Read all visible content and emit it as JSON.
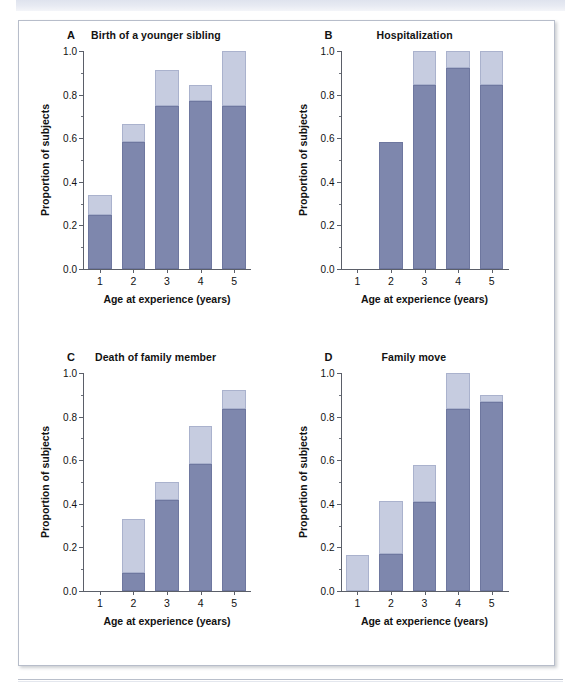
{
  "figure": {
    "axis_color": "#5b5f69",
    "frame_color": "#b7bdca",
    "dark_color": "#7e87ad",
    "light_color": "#c6cce0",
    "y_label": "Proportion of subjects",
    "x_label": "Age at experience (years)",
    "y_ticks": [
      "0.0",
      "0.2",
      "0.4",
      "0.6",
      "0.8",
      "1.0"
    ],
    "x_ticks": [
      "1",
      "2",
      "3",
      "4",
      "5"
    ]
  },
  "panels": [
    {
      "letter": "A",
      "title": "Birth of a younger sibling"
    },
    {
      "letter": "B",
      "title": "Hospitalization"
    },
    {
      "letter": "C",
      "title": "Death of family member"
    },
    {
      "letter": "D",
      "title": "Family move"
    }
  ],
  "chart_data": [
    {
      "type": "bar",
      "panel": "A",
      "title": "Birth of a younger sibling",
      "xlabel": "Age at experience (years)",
      "ylabel": "Proportion of subjects",
      "ylim": [
        0,
        1.0
      ],
      "ytick_values": [
        0.0,
        0.2,
        0.4,
        0.6,
        0.8,
        1.0
      ],
      "grid": false,
      "legend": "none",
      "stacked": true,
      "categories": [
        "1",
        "2",
        "3",
        "4",
        "5"
      ],
      "series": [
        {
          "name": "dark",
          "values": [
            0.25,
            0.585,
            0.75,
            0.77,
            0.75
          ]
        },
        {
          "name": "light",
          "values": [
            0.09,
            0.08,
            0.165,
            0.075,
            0.25
          ]
        }
      ],
      "totals": [
        0.34,
        0.665,
        0.915,
        0.845,
        1.0
      ]
    },
    {
      "type": "bar",
      "panel": "B",
      "title": "Hospitalization",
      "xlabel": "Age at experience (years)",
      "ylabel": "Proportion of subjects",
      "ylim": [
        0,
        1.0
      ],
      "ytick_values": [
        0.0,
        0.2,
        0.4,
        0.6,
        0.8,
        1.0
      ],
      "grid": false,
      "legend": "none",
      "stacked": true,
      "categories": [
        "1",
        "2",
        "3",
        "4",
        "5"
      ],
      "series": [
        {
          "name": "dark",
          "values": [
            0.0,
            0.583,
            0.843,
            0.92,
            0.843
          ]
        },
        {
          "name": "light",
          "values": [
            0.0,
            0.0,
            0.157,
            0.08,
            0.157
          ]
        }
      ],
      "totals": [
        0.0,
        0.583,
        1.0,
        1.0,
        1.0
      ]
    },
    {
      "type": "bar",
      "panel": "C",
      "title": "Death of family member",
      "xlabel": "Age at experience (years)",
      "ylabel": "Proportion of subjects",
      "ylim": [
        0,
        1.0
      ],
      "ytick_values": [
        0.0,
        0.2,
        0.4,
        0.6,
        0.8,
        1.0
      ],
      "grid": false,
      "legend": "none",
      "stacked": true,
      "categories": [
        "1",
        "2",
        "3",
        "4",
        "5"
      ],
      "series": [
        {
          "name": "dark",
          "values": [
            0.0,
            0.083,
            0.417,
            0.585,
            0.833
          ]
        },
        {
          "name": "light",
          "values": [
            0.0,
            0.247,
            0.083,
            0.17,
            0.087
          ]
        }
      ],
      "totals": [
        0.0,
        0.33,
        0.5,
        0.755,
        0.92
      ]
    },
    {
      "type": "bar",
      "panel": "D",
      "title": "Family move",
      "xlabel": "Age at experience (years)",
      "ylabel": "Proportion of subjects",
      "ylim": [
        0,
        1.0
      ],
      "ytick_values": [
        0.0,
        0.2,
        0.4,
        0.6,
        0.8,
        1.0
      ],
      "grid": false,
      "legend": "none",
      "stacked": true,
      "categories": [
        "1",
        "2",
        "3",
        "4",
        "5"
      ],
      "series": [
        {
          "name": "dark",
          "values": [
            0.0,
            0.17,
            0.41,
            0.833,
            0.865
          ]
        },
        {
          "name": "light",
          "values": [
            0.167,
            0.243,
            0.17,
            0.167,
            0.035
          ]
        }
      ],
      "totals": [
        0.167,
        0.413,
        0.58,
        1.0,
        0.9
      ]
    }
  ]
}
